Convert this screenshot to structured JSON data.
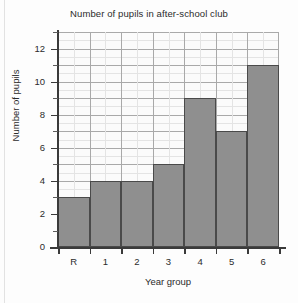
{
  "chart_data": {
    "type": "bar",
    "title": "Number of pupils in after-school club",
    "xlabel": "Year group",
    "ylabel": "Number of pupils",
    "categories": [
      "R",
      "1",
      "2",
      "3",
      "4",
      "5",
      "6"
    ],
    "values": [
      3,
      4,
      4,
      5,
      9,
      7,
      11
    ],
    "ylim": [
      0,
      13
    ],
    "y_tick_labels": [
      "0",
      "2",
      "4",
      "6",
      "8",
      "10",
      "12"
    ],
    "y_tick_values": [
      0,
      2,
      4,
      6,
      8,
      10,
      12
    ],
    "y_minor_tick_values": [
      1,
      3,
      5,
      7,
      9,
      11,
      13
    ],
    "grid": true,
    "legend": "none",
    "bar_color": "#8f8f8f",
    "bar_border_color": "#4a4a4a",
    "axis_color": "#3a3a3a",
    "grid_major_color": "#a9a9a9",
    "grid_minor_color": "#e4e4e4",
    "plot_background": "#fbfbfb",
    "page_background": "#fdfdfd",
    "bars_contiguous": true
  }
}
